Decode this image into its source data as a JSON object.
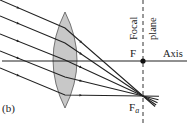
{
  "figure": {
    "panel_label": "(b)",
    "labels": {
      "focal_plane_line1": "Focal",
      "focal_plane_line2": "plane",
      "focal_point": "F",
      "off_axis_focal_point_main": "F",
      "off_axis_focal_point_sub": "a",
      "axis": "Axis"
    },
    "colors": {
      "ray": "#222222",
      "lens_fill": "#c8c8c8",
      "lens_stroke": "#555555",
      "axis": "#222222",
      "focal_plane": "#333333"
    },
    "geometry": {
      "axis_y": 61,
      "focal_plane_x": 143,
      "lens": {
        "cx": 65,
        "top": 12,
        "bottom": 108,
        "half_width": 12
      },
      "F": {
        "x": 143,
        "y": 61
      },
      "Fa": {
        "x": 143,
        "y": 96
      },
      "rays": [
        {
          "x0": 0,
          "y0": 0,
          "xl": 65,
          "yl": 28
        },
        {
          "x0": 0,
          "y0": 16,
          "xl": 65,
          "yl": 43
        },
        {
          "x0": 0,
          "y0": 34,
          "xl": 65,
          "yl": 60
        },
        {
          "x0": 0,
          "y0": 51,
          "xl": 65,
          "yl": 77
        },
        {
          "x0": 0,
          "y0": 68,
          "xl": 65,
          "yl": 95
        }
      ]
    }
  }
}
